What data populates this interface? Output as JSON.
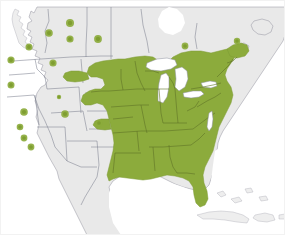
{
  "figure": {
    "kind": "species-range-map",
    "region": "North America",
    "width": 285,
    "height": 235,
    "background_color": "#ffffff"
  },
  "legend_colors": {
    "range_green": "#8cab3c",
    "range_green_outline": "#5f7326",
    "land_gray": "#e9e9e9",
    "land_outline": "#9a9aa6",
    "subdivision_line": "#7d8190",
    "lake_white": "#ffffff",
    "dot_green": "#8cab3c",
    "dot_core_green": "#7f9e31",
    "frame_gray": "#f2f2f2"
  },
  "map_layers": {
    "continuous_range_label": "continuous breeding range",
    "dot_label": "isolated population record",
    "land_label": "land outside range",
    "lakes_label": "great lakes"
  },
  "chart_data": {
    "type": "map",
    "title": "",
    "projection_hint": "north-america-conic",
    "continuous_range_extent": {
      "north_limit": "southern Canada / Great Lakes",
      "west_limit": "eastern Great Plains",
      "south_limit": "Gulf Coast and Florida",
      "east_limit": "Atlantic seaboard"
    },
    "isolated_population_dots": [
      {
        "id": "d01",
        "cx": 69,
        "cy": 22,
        "r": 4.0
      },
      {
        "id": "d02",
        "cx": 48,
        "cy": 32,
        "r": 3.8
      },
      {
        "id": "d03",
        "cx": 69,
        "cy": 38,
        "r": 3.6
      },
      {
        "id": "d04",
        "cx": 97,
        "cy": 38,
        "r": 3.9
      },
      {
        "id": "d05",
        "cx": 28,
        "cy": 46,
        "r": 3.5
      },
      {
        "id": "d06",
        "cx": 10,
        "cy": 59,
        "r": 3.6
      },
      {
        "id": "d07",
        "cx": 52,
        "cy": 62,
        "r": 3.6
      },
      {
        "id": "d08",
        "cx": 184,
        "cy": 45,
        "r": 3.4
      },
      {
        "id": "d09",
        "cx": 236,
        "cy": 40,
        "r": 3.2
      },
      {
        "id": "d10",
        "cx": 10,
        "cy": 84,
        "r": 3.5
      },
      {
        "id": "d11",
        "cx": 23,
        "cy": 111,
        "r": 3.8
      },
      {
        "id": "d12",
        "cx": 64,
        "cy": 113,
        "r": 3.8
      },
      {
        "id": "d13",
        "cx": 98,
        "cy": 122,
        "r": 3.4
      },
      {
        "id": "d14",
        "cx": 19,
        "cy": 126,
        "r": 3.3
      },
      {
        "id": "d15",
        "cx": 23,
        "cy": 137,
        "r": 3.4
      },
      {
        "id": "d16",
        "cx": 30,
        "cy": 146,
        "r": 3.4
      },
      {
        "id": "d17",
        "cx": 58,
        "cy": 96,
        "r": 2.2
      }
    ],
    "great_lakes": [
      "Superior",
      "Michigan",
      "Huron",
      "Erie",
      "Ontario"
    ],
    "notable_features": [
      "Florida peninsula shaded green to near southern tip",
      "Green boundary cuts through eastern Texas",
      "Great Lakes rendered white inside green range",
      "Scattered dots across western mountains and Pacific coast",
      "Cuba, Hispaniola and Bahamas drawn in gray outline only"
    ]
  }
}
